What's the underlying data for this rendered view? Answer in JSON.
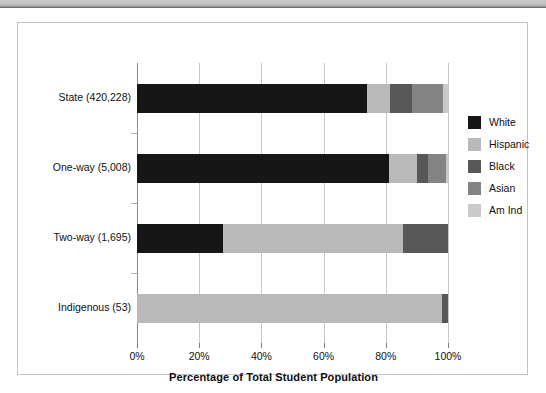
{
  "page": {
    "banner_region": "scanned-page-header-strip"
  },
  "chart_data": {
    "type": "bar",
    "orientation": "horizontal",
    "stacked": true,
    "title": "",
    "xlabel": "Percentage of Total Student Population",
    "ylabel": "",
    "xlim": [
      0,
      100
    ],
    "xticks": [
      "0%",
      "20%",
      "40%",
      "60%",
      "80%",
      "100%"
    ],
    "xtick_values": [
      0,
      20,
      40,
      60,
      80,
      100
    ],
    "grid": true,
    "legend_position": "right",
    "categories": [
      "State (420,228)",
      "One-way (5,008)",
      "Two-way (1,695)",
      "Indigenous (53)"
    ],
    "series": [
      {
        "name": "White",
        "color": "#161616",
        "values": [
          74.0,
          81.0,
          27.5,
          0.0
        ]
      },
      {
        "name": "Hispanic",
        "color": "#b9b9b9",
        "values": [
          7.5,
          9.0,
          58.0,
          98.0
        ]
      },
      {
        "name": "Black",
        "color": "#575757",
        "values": [
          7.0,
          3.5,
          14.5,
          2.0
        ]
      },
      {
        "name": "Asian",
        "color": "#848484",
        "values": [
          10.0,
          6.0,
          0.0,
          0.0
        ]
      },
      {
        "name": "Am Ind",
        "color": "#cacaca",
        "values": [
          1.5,
          0.5,
          0.0,
          0.0
        ]
      }
    ],
    "legend_entries": [
      "White",
      "Hispanic",
      "Black",
      "Asian",
      "Am Ind"
    ]
  },
  "colors": {
    "frame_border": "#c3c3c3",
    "gridline": "#c7c7c7",
    "axis": "#8a8a8a",
    "text": "#111111",
    "banner": "#c2c2c2"
  }
}
